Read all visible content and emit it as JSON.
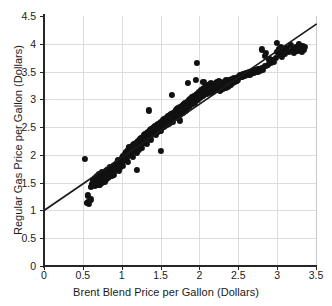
{
  "figure": {
    "width": 332,
    "height": 306,
    "background": "#ffffff",
    "marker_color": "#111111",
    "gridline_color": "#dcdcdc",
    "axis_color": "#262626",
    "fitline_color": "#1a1a1a"
  },
  "chart_data": {
    "type": "scatter",
    "title": "",
    "xlabel": "Brent Blend Price per Gallon (Dollars)",
    "ylabel": "Regular Gas Price per Gallon (Dollars)",
    "xlim": [
      0,
      3.5
    ],
    "ylim": [
      0,
      4.5
    ],
    "xticks": [
      0,
      0.5,
      1,
      1.5,
      2,
      2.5,
      3,
      3.5
    ],
    "xtick_labels": [
      "0",
      "0.5",
      "1",
      "1.5",
      "2",
      "2.5",
      "3",
      "3.5"
    ],
    "yticks": [
      0,
      0.5,
      1,
      1.5,
      2,
      2.5,
      3,
      3.5,
      4,
      4.5
    ],
    "ytick_labels": [
      "0",
      "0.5",
      "1",
      "1.5",
      "2",
      "2.5",
      "3",
      "3.5",
      "4",
      "4.5"
    ],
    "grid": true,
    "legend": null,
    "marker_size": 6.2,
    "fit_line": {
      "label": "linear trend",
      "x": [
        0,
        3.5
      ],
      "y": [
        1.0,
        4.35
      ],
      "slope": 0.957,
      "intercept": 1.0
    },
    "points": [
      [
        0.53,
        1.93
      ],
      [
        0.55,
        1.13
      ],
      [
        0.56,
        1.16
      ],
      [
        0.57,
        1.27
      ],
      [
        0.58,
        1.12
      ],
      [
        0.6,
        1.2
      ],
      [
        0.62,
        1.48
      ],
      [
        0.63,
        1.55
      ],
      [
        0.64,
        1.5
      ],
      [
        0.65,
        1.52
      ],
      [
        0.66,
        1.58
      ],
      [
        0.67,
        1.49
      ],
      [
        0.68,
        1.62
      ],
      [
        0.69,
        1.56
      ],
      [
        0.7,
        1.6
      ],
      [
        0.7,
        1.47
      ],
      [
        0.71,
        1.65
      ],
      [
        0.72,
        1.55
      ],
      [
        0.73,
        1.58
      ],
      [
        0.74,
        1.63
      ],
      [
        0.75,
        1.57
      ],
      [
        0.75,
        1.7
      ],
      [
        0.76,
        1.62
      ],
      [
        0.77,
        1.66
      ],
      [
        0.78,
        1.59
      ],
      [
        0.79,
        1.64
      ],
      [
        0.8,
        1.68
      ],
      [
        0.8,
        1.56
      ],
      [
        0.81,
        1.72
      ],
      [
        0.82,
        1.63
      ],
      [
        0.83,
        1.69
      ],
      [
        0.84,
        1.75
      ],
      [
        0.85,
        1.66
      ],
      [
        0.85,
        1.78
      ],
      [
        0.86,
        1.71
      ],
      [
        0.87,
        1.62
      ],
      [
        0.88,
        1.74
      ],
      [
        0.89,
        1.68
      ],
      [
        0.9,
        1.8
      ],
      [
        0.9,
        1.7
      ],
      [
        0.91,
        1.76
      ],
      [
        0.92,
        1.82
      ],
      [
        0.93,
        1.73
      ],
      [
        0.94,
        1.86
      ],
      [
        0.95,
        1.79
      ],
      [
        0.95,
        1.9
      ],
      [
        0.96,
        1.84
      ],
      [
        0.97,
        1.76
      ],
      [
        0.98,
        1.88
      ],
      [
        0.99,
        1.82
      ],
      [
        1.0,
        1.95
      ],
      [
        1.0,
        1.86
      ],
      [
        1.01,
        1.9
      ],
      [
        1.02,
        1.98
      ],
      [
        1.03,
        1.92
      ],
      [
        1.04,
        2.02
      ],
      [
        1.05,
        1.96
      ],
      [
        1.06,
        2.05
      ],
      [
        1.07,
        1.99
      ],
      [
        1.08,
        2.08
      ],
      [
        1.09,
        2.0
      ],
      [
        1.1,
        2.1
      ],
      [
        1.1,
        2.02
      ],
      [
        1.11,
        2.12
      ],
      [
        1.12,
        2.06
      ],
      [
        1.13,
        2.15
      ],
      [
        1.14,
        2.08
      ],
      [
        1.15,
        2.18
      ],
      [
        1.16,
        2.1
      ],
      [
        1.17,
        2.2
      ],
      [
        1.18,
        2.13
      ],
      [
        1.19,
        2.22
      ],
      [
        1.2,
        1.73
      ],
      [
        1.2,
        2.16
      ],
      [
        1.21,
        2.25
      ],
      [
        1.22,
        2.18
      ],
      [
        1.23,
        2.28
      ],
      [
        1.24,
        2.2
      ],
      [
        1.25,
        2.3
      ],
      [
        1.26,
        2.23
      ],
      [
        1.27,
        2.32
      ],
      [
        1.28,
        2.25
      ],
      [
        1.29,
        2.35
      ],
      [
        1.3,
        2.28
      ],
      [
        1.3,
        2.38
      ],
      [
        1.31,
        2.3
      ],
      [
        1.32,
        2.4
      ],
      [
        1.33,
        2.33
      ],
      [
        1.34,
        2.42
      ],
      [
        1.35,
        2.8
      ],
      [
        1.35,
        2.35
      ],
      [
        1.36,
        2.44
      ],
      [
        1.37,
        2.37
      ],
      [
        1.38,
        2.46
      ],
      [
        1.39,
        2.39
      ],
      [
        1.4,
        2.48
      ],
      [
        1.4,
        2.41
      ],
      [
        1.41,
        2.5
      ],
      [
        1.42,
        2.43
      ],
      [
        1.43,
        2.52
      ],
      [
        1.44,
        2.45
      ],
      [
        1.45,
        2.54
      ],
      [
        1.46,
        2.47
      ],
      [
        1.47,
        2.56
      ],
      [
        1.48,
        2.49
      ],
      [
        1.49,
        2.58
      ],
      [
        1.5,
        2.07
      ],
      [
        1.5,
        2.5
      ],
      [
        1.51,
        2.6
      ],
      [
        1.52,
        2.53
      ],
      [
        1.53,
        2.62
      ],
      [
        1.54,
        2.55
      ],
      [
        1.55,
        2.64
      ],
      [
        1.56,
        2.57
      ],
      [
        1.57,
        2.66
      ],
      [
        1.58,
        2.59
      ],
      [
        1.59,
        2.68
      ],
      [
        1.6,
        2.6
      ],
      [
        1.6,
        2.7
      ],
      [
        1.61,
        2.63
      ],
      [
        1.62,
        2.72
      ],
      [
        1.63,
        2.65
      ],
      [
        1.64,
        2.74
      ],
      [
        1.65,
        2.67
      ],
      [
        1.65,
        3.08
      ],
      [
        1.66,
        2.76
      ],
      [
        1.67,
        2.69
      ],
      [
        1.68,
        2.78
      ],
      [
        1.69,
        2.71
      ],
      [
        1.7,
        2.8
      ],
      [
        1.7,
        2.73
      ],
      [
        1.71,
        2.82
      ],
      [
        1.72,
        2.75
      ],
      [
        1.73,
        2.84
      ],
      [
        1.74,
        2.77
      ],
      [
        1.75,
        2.86
      ],
      [
        1.75,
        2.62
      ],
      [
        1.76,
        2.79
      ],
      [
        1.77,
        2.88
      ],
      [
        1.78,
        2.81
      ],
      [
        1.79,
        2.9
      ],
      [
        1.8,
        2.83
      ],
      [
        1.8,
        2.92
      ],
      [
        1.81,
        2.85
      ],
      [
        1.82,
        2.94
      ],
      [
        1.83,
        2.87
      ],
      [
        1.84,
        2.96
      ],
      [
        1.85,
        2.89
      ],
      [
        1.85,
        3.3
      ],
      [
        1.86,
        2.98
      ],
      [
        1.87,
        2.91
      ],
      [
        1.88,
        3.0
      ],
      [
        1.89,
        2.93
      ],
      [
        1.9,
        3.02
      ],
      [
        1.9,
        2.95
      ],
      [
        1.91,
        3.04
      ],
      [
        1.92,
        2.97
      ],
      [
        1.93,
        3.06
      ],
      [
        1.94,
        2.99
      ],
      [
        1.95,
        3.08
      ],
      [
        1.95,
        3.35
      ],
      [
        1.96,
        3.01
      ],
      [
        1.97,
        3.65
      ],
      [
        1.97,
        3.1
      ],
      [
        1.98,
        3.03
      ],
      [
        1.99,
        3.12
      ],
      [
        2.0,
        3.05
      ],
      [
        2.0,
        3.14
      ],
      [
        2.01,
        3.07
      ],
      [
        2.02,
        3.16
      ],
      [
        2.03,
        3.09
      ],
      [
        2.04,
        3.18
      ],
      [
        2.05,
        3.11
      ],
      [
        2.05,
        3.32
      ],
      [
        2.06,
        3.2
      ],
      [
        2.07,
        3.13
      ],
      [
        2.08,
        3.22
      ],
      [
        2.09,
        3.15
      ],
      [
        2.1,
        3.24
      ],
      [
        2.1,
        3.17
      ],
      [
        2.11,
        3.26
      ],
      [
        2.12,
        3.19
      ],
      [
        2.13,
        3.28
      ],
      [
        2.14,
        3.21
      ],
      [
        2.15,
        3.12
      ],
      [
        2.15,
        3.3
      ],
      [
        2.16,
        3.23
      ],
      [
        2.17,
        3.14
      ],
      [
        2.18,
        3.25
      ],
      [
        2.19,
        3.16
      ],
      [
        2.2,
        3.27
      ],
      [
        2.2,
        3.18
      ],
      [
        2.21,
        3.29
      ],
      [
        2.22,
        3.2
      ],
      [
        2.23,
        3.31
      ],
      [
        2.24,
        3.22
      ],
      [
        2.25,
        3.33
      ],
      [
        2.25,
        3.24
      ],
      [
        2.26,
        3.15
      ],
      [
        2.27,
        3.26
      ],
      [
        2.28,
        3.17
      ],
      [
        2.29,
        3.28
      ],
      [
        2.3,
        3.19
      ],
      [
        2.3,
        3.3
      ],
      [
        2.31,
        3.21
      ],
      [
        2.32,
        3.32
      ],
      [
        2.33,
        3.23
      ],
      [
        2.34,
        3.2
      ],
      [
        2.35,
        3.25
      ],
      [
        2.36,
        3.22
      ],
      [
        2.37,
        3.27
      ],
      [
        2.38,
        3.24
      ],
      [
        2.39,
        3.29
      ],
      [
        2.4,
        3.26
      ],
      [
        2.4,
        3.31
      ],
      [
        2.41,
        3.28
      ],
      [
        2.42,
        3.33
      ],
      [
        2.43,
        3.3
      ],
      [
        2.44,
        3.35
      ],
      [
        2.45,
        3.32
      ],
      [
        2.46,
        3.37
      ],
      [
        2.47,
        3.34
      ],
      [
        2.48,
        3.39
      ],
      [
        2.49,
        3.36
      ],
      [
        2.5,
        3.41
      ],
      [
        2.5,
        3.38
      ],
      [
        2.52,
        3.43
      ],
      [
        2.54,
        3.4
      ],
      [
        2.56,
        3.45
      ],
      [
        2.58,
        3.42
      ],
      [
        2.6,
        3.47
      ],
      [
        2.62,
        3.44
      ],
      [
        2.64,
        3.49
      ],
      [
        2.66,
        3.46
      ],
      [
        2.68,
        3.51
      ],
      [
        2.7,
        3.48
      ],
      [
        2.72,
        3.53
      ],
      [
        2.74,
        3.5
      ],
      [
        2.76,
        3.55
      ],
      [
        2.78,
        3.52
      ],
      [
        2.8,
        3.9
      ],
      [
        2.8,
        3.57
      ],
      [
        2.82,
        3.54
      ],
      [
        2.84,
        3.78
      ],
      [
        2.85,
        3.6
      ],
      [
        2.86,
        3.83
      ],
      [
        2.88,
        3.62
      ],
      [
        2.9,
        3.72
      ],
      [
        2.92,
        3.65
      ],
      [
        2.94,
        3.7
      ],
      [
        2.96,
        3.68
      ],
      [
        2.98,
        3.74
      ],
      [
        3.0,
        4.02
      ],
      [
        3.0,
        3.85
      ],
      [
        3.02,
        3.9
      ],
      [
        3.04,
        3.8
      ],
      [
        3.05,
        3.95
      ],
      [
        3.06,
        3.76
      ],
      [
        3.08,
        3.88
      ],
      [
        3.1,
        3.82
      ],
      [
        3.12,
        3.92
      ],
      [
        3.15,
        3.86
      ],
      [
        3.18,
        3.98
      ],
      [
        3.2,
        3.9
      ],
      [
        3.22,
        3.84
      ],
      [
        3.24,
        3.94
      ],
      [
        3.26,
        3.88
      ],
      [
        3.28,
        4.0
      ],
      [
        3.3,
        3.92
      ],
      [
        3.32,
        3.86
      ],
      [
        3.33,
        3.96
      ],
      [
        3.34,
        3.9
      ],
      [
        3.35,
        3.95
      ],
      [
        0.72,
        1.46
      ],
      [
        0.78,
        1.52
      ],
      [
        0.84,
        1.6
      ],
      [
        0.9,
        1.64
      ],
      [
        0.96,
        1.72
      ],
      [
        1.02,
        1.8
      ],
      [
        1.08,
        1.88
      ],
      [
        1.14,
        1.96
      ],
      [
        1.2,
        2.04
      ],
      [
        1.26,
        2.12
      ],
      [
        1.32,
        2.2
      ],
      [
        1.38,
        2.28
      ],
      [
        1.44,
        2.36
      ],
      [
        1.5,
        2.44
      ],
      [
        1.56,
        2.52
      ],
      [
        1.62,
        2.58
      ],
      [
        1.68,
        2.66
      ],
      [
        1.74,
        2.72
      ],
      [
        1.8,
        2.78
      ],
      [
        1.86,
        2.86
      ],
      [
        1.92,
        2.92
      ],
      [
        1.98,
        3.0
      ],
      [
        2.04,
        3.06
      ],
      [
        2.1,
        3.1
      ],
      [
        2.16,
        3.18
      ],
      [
        2.22,
        3.24
      ],
      [
        2.28,
        3.3
      ],
      [
        2.34,
        3.34
      ],
      [
        1.1,
        2.14
      ],
      [
        1.16,
        2.2
      ],
      [
        0.86,
        1.68
      ],
      [
        0.92,
        1.74
      ],
      [
        0.98,
        1.8
      ],
      [
        1.04,
        1.92
      ],
      [
        1.46,
        2.42
      ],
      [
        1.52,
        2.48
      ],
      [
        1.58,
        2.54
      ],
      [
        1.64,
        2.62
      ],
      [
        1.7,
        2.68
      ],
      [
        1.76,
        2.74
      ],
      [
        1.82,
        2.8
      ],
      [
        1.88,
        2.88
      ],
      [
        1.94,
        2.94
      ],
      [
        2.0,
        3.02
      ],
      [
        2.06,
        3.08
      ],
      [
        2.12,
        3.16
      ],
      [
        2.18,
        3.22
      ],
      [
        2.24,
        3.28
      ],
      [
        2.32,
        3.26
      ],
      [
        2.38,
        3.34
      ],
      [
        0.66,
        1.44
      ],
      [
        0.7,
        1.54
      ],
      [
        0.74,
        1.5
      ],
      [
        0.82,
        1.58
      ],
      [
        0.88,
        1.66
      ],
      [
        1.12,
        2.0
      ],
      [
        1.18,
        2.08
      ],
      [
        1.24,
        2.14
      ],
      [
        1.28,
        2.22
      ],
      [
        1.34,
        2.3
      ],
      [
        1.42,
        2.38
      ],
      [
        1.54,
        2.5
      ],
      [
        1.66,
        2.6
      ],
      [
        1.78,
        2.76
      ],
      [
        1.84,
        2.84
      ],
      [
        2.08,
        3.12
      ],
      [
        2.14,
        3.2
      ],
      [
        2.26,
        3.32
      ],
      [
        2.36,
        3.3
      ],
      [
        2.44,
        3.38
      ],
      [
        0.6,
        1.42
      ],
      [
        0.64,
        1.46
      ],
      [
        0.68,
        1.5
      ],
      [
        1.06,
        1.94
      ],
      [
        1.22,
        2.1
      ],
      [
        1.36,
        2.32
      ],
      [
        1.48,
        2.46
      ],
      [
        1.6,
        2.56
      ],
      [
        1.72,
        2.7
      ],
      [
        2.02,
        3.04
      ],
      [
        2.42,
        3.36
      ],
      [
        2.48,
        3.34
      ],
      [
        2.55,
        3.4
      ],
      [
        2.65,
        3.44
      ],
      [
        2.75,
        3.5
      ]
    ]
  }
}
